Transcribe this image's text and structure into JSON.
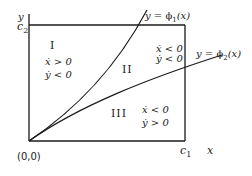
{
  "diagram": {
    "axes": {
      "x_label": "x",
      "y_label": "y",
      "origin_label": "(0,0)",
      "x_bound_label": "c1",
      "x_bound_main": "c",
      "x_bound_sub": "1",
      "y_bound_main": "c",
      "y_bound_sub": "2"
    },
    "curves": [
      {
        "id": "phi1",
        "label_prefix": "y = ",
        "label_func": "ϕ",
        "label_sub": "1",
        "label_arg": "(x)"
      },
      {
        "id": "phi2",
        "label_prefix": "y = ",
        "label_func": "ϕ",
        "label_sub": "2",
        "label_arg": "(x)"
      }
    ],
    "regions": [
      {
        "name": "I",
        "xdot": "ẋ > 0",
        "ydot": "ẏ < 0"
      },
      {
        "name": "II",
        "xdot": "ẋ < 0",
        "ydot": "ẏ < 0"
      },
      {
        "name": "III",
        "xdot": "ẋ < 0",
        "ydot": "ẏ > 0"
      }
    ]
  }
}
